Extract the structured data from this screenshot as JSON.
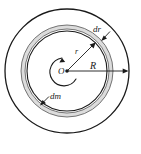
{
  "figure": {
    "caption": "",
    "background_color": "#ffffff",
    "stroke_color": "#1a1a1a",
    "ring_fill_color": "#d9d9d9",
    "labels": {
      "center": "O",
      "inner_radius": "r",
      "outer_radius": "R",
      "ring_thickness": "dr",
      "ring_mass": "dm"
    },
    "geometry": {
      "center_x": 67,
      "center_y": 71,
      "outer_circle_radius": 62,
      "ring_outer_radius": 46,
      "ring_inner_radius": 42,
      "inner_circle_radius": 40,
      "r_arrow_angle_deg": 52,
      "R_arrow_angle_deg": 0
    },
    "annotations": [
      {
        "name": "rotation-arc",
        "description": "curved arrow arc about center O"
      },
      {
        "name": "r-leader",
        "description": "arrow from center O to inner ring labeled r"
      },
      {
        "name": "R-leader",
        "description": "arrow from center O to outer circle labeled R"
      },
      {
        "name": "dr-leader",
        "description": "pointer arrow to ring thickness labeled dr"
      },
      {
        "name": "dm-leader",
        "description": "pointer arrow to ring element labeled dm"
      }
    ]
  }
}
